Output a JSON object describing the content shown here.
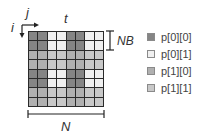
{
  "axes": {
    "i_label": "i",
    "j_label": "j",
    "t_label": "t",
    "nb_label": "NB",
    "n_label": "N"
  },
  "colors": {
    "p00": "#858585",
    "p01": "#f0f0f0",
    "p10": "#b0b0b0",
    "p11": "#c8c8c8",
    "grid_line": "#2a2a2a"
  },
  "grid": {
    "rows": 8,
    "cols": 8,
    "cells": [
      [
        "p00",
        "p00",
        "p01",
        "p01",
        "p00",
        "p00",
        "p01",
        "p01"
      ],
      [
        "p00",
        "p00",
        "p01",
        "p01",
        "p00",
        "p00",
        "p01",
        "p01"
      ],
      [
        "p10",
        "p10",
        "p11",
        "p11",
        "p10",
        "p10",
        "p11",
        "p11"
      ],
      [
        "p10",
        "p10",
        "p11",
        "p11",
        "p10",
        "p10",
        "p11",
        "p11"
      ],
      [
        "p00",
        "p00",
        "p01",
        "p01",
        "p00",
        "p00",
        "p01",
        "p01"
      ],
      [
        "p00",
        "p00",
        "p01",
        "p01",
        "p00",
        "p00",
        "p01",
        "p01"
      ],
      [
        "p10",
        "p10",
        "p11",
        "p11",
        "p10",
        "p10",
        "p11",
        "p11"
      ],
      [
        "p10",
        "p10",
        "p11",
        "p11",
        "p10",
        "p10",
        "p11",
        "p11"
      ]
    ]
  },
  "legend": {
    "items": [
      {
        "key": "p00",
        "label": "p[0][0]"
      },
      {
        "key": "p01",
        "label": "p[0][1]"
      },
      {
        "key": "p10",
        "label": "p[1][0]"
      },
      {
        "key": "p11",
        "label": "p[1][1]"
      }
    ]
  }
}
